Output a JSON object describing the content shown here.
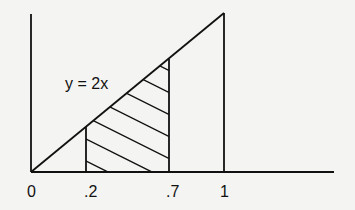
{
  "diagram": {
    "curve_label": "y = 2x",
    "x_ticks": [
      {
        "label": "0",
        "value": 0
      },
      {
        "label": ".2",
        "value": 0.2
      },
      {
        "label": ".7",
        "value": 0.7
      },
      {
        "label": "1",
        "value": 1
      }
    ],
    "shaded_region": {
      "from": 0.2,
      "to": 0.7,
      "pattern": "diagonal-hatch"
    },
    "function": "y = 2x",
    "domain": [
      0,
      1
    ],
    "colors": {
      "line": "#111111",
      "background": "#f4f4f2"
    }
  }
}
